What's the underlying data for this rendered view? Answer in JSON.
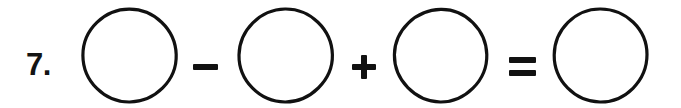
{
  "worksheet": {
    "problem_number": "7.",
    "background_color": "#ffffff",
    "ink_color": "#111111",
    "canvas": {
      "width": 681,
      "height": 108
    },
    "equation_text": "7.  ○ − ○ + ○ = ○",
    "elements": [
      {
        "kind": "label",
        "name": "problem-number",
        "text": "7.",
        "x": 26,
        "y": 46
      },
      {
        "kind": "circle",
        "name": "answer-circle-1",
        "icon": "empty-circle-icon",
        "value": "",
        "x": 80,
        "y": 6,
        "diameter": 99
      },
      {
        "kind": "operator",
        "name": "operator-minus",
        "symbol": "−",
        "label": "minus",
        "x": 193,
        "y": 64
      },
      {
        "kind": "circle",
        "name": "answer-circle-2",
        "icon": "empty-circle-icon",
        "value": "",
        "x": 236,
        "y": 6,
        "diameter": 99
      },
      {
        "kind": "operator",
        "name": "operator-plus",
        "symbol": "+",
        "label": "plus",
        "x": 352,
        "y": 55
      },
      {
        "kind": "circle",
        "name": "answer-circle-3",
        "icon": "empty-circle-icon",
        "value": "",
        "x": 391,
        "y": 6,
        "diameter": 99
      },
      {
        "kind": "operator",
        "name": "operator-equals",
        "symbol": "=",
        "label": "equals",
        "x": 509,
        "y": 57
      },
      {
        "kind": "circle",
        "name": "answer-circle-4",
        "icon": "empty-circle-icon",
        "value": "",
        "x": 551,
        "y": 6,
        "diameter": 99
      }
    ],
    "circles": [
      {
        "name": "answer-circle-1",
        "value": "",
        "left": 80,
        "top": 6
      },
      {
        "name": "answer-circle-2",
        "value": "",
        "left": 236,
        "top": 6
      },
      {
        "name": "answer-circle-3",
        "value": "",
        "left": 391,
        "top": 6
      },
      {
        "name": "answer-circle-4",
        "value": "",
        "left": 551,
        "top": 6
      }
    ],
    "operators": {
      "minus": "−",
      "plus": "+",
      "equals": "="
    }
  }
}
